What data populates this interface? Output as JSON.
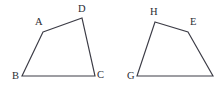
{
  "figure": {
    "background_color": "#ffffff",
    "stroke_color": "#3c3c46",
    "label_color": "#2b2b33",
    "stroke_width": 1.15,
    "canvas": {
      "width": 216,
      "height": 90
    },
    "shapes": [
      {
        "id": "quadrilateral-left",
        "name": "ABCD",
        "closed": true,
        "path": "M 43 32 L 82 18 L 95 76 L 22 76 Z",
        "vertices": [
          {
            "label": "A",
            "x": 43,
            "y": 32,
            "label_x": 35,
            "label_y": 25
          },
          {
            "label": "D",
            "x": 82,
            "y": 18,
            "label_x": 78,
            "label_y": 12
          },
          {
            "label": "C",
            "x": 95,
            "y": 76,
            "label_x": 97,
            "label_y": 78
          },
          {
            "label": "B",
            "x": 22,
            "y": 76,
            "label_x": 12,
            "label_y": 79
          }
        ]
      },
      {
        "id": "quadrilateral-right",
        "name": "HEFG",
        "closed": true,
        "path": "M 155 22 L 188 32 L 213 76 L 137 76 Z",
        "vertices": [
          {
            "label": "H",
            "x": 155,
            "y": 22,
            "label_x": 150,
            "label_y": 15
          },
          {
            "label": "E",
            "x": 188,
            "y": 32,
            "label_x": 190,
            "label_y": 25
          },
          {
            "label": "",
            "x": 213,
            "y": 76,
            "label_x": 215,
            "label_y": 78
          },
          {
            "label": "G",
            "x": 137,
            "y": 76,
            "label_x": 127,
            "label_y": 79
          }
        ]
      }
    ]
  }
}
